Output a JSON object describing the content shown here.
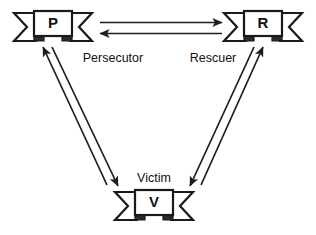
{
  "diagram": {
    "background_color": "#ffffff",
    "line_color": "#1d1d1d",
    "text_color": "#111111",
    "nodes": [
      {
        "id": "persecutor",
        "letter": "P",
        "label": "Persecutor",
        "shape": "ribbon-banner",
        "position": "top-left"
      },
      {
        "id": "rescuer",
        "letter": "R",
        "label": "Rescuer",
        "shape": "ribbon-banner",
        "position": "top-right"
      },
      {
        "id": "victim",
        "letter": "V",
        "label": "Victim",
        "shape": "ribbon-banner",
        "position": "bottom-center"
      }
    ],
    "edges": [
      {
        "id": "persecutor-to-rescuer",
        "from": "persecutor",
        "to": "rescuer",
        "direction": "right",
        "style": "single-arrow"
      },
      {
        "id": "rescuer-to-persecutor",
        "from": "rescuer",
        "to": "persecutor",
        "direction": "left",
        "style": "single-arrow"
      },
      {
        "id": "victim-to-persecutor",
        "from": "victim",
        "to": "persecutor",
        "direction": "up-left",
        "style": "single-arrow"
      },
      {
        "id": "persecutor-to-victim",
        "from": "persecutor",
        "to": "victim",
        "direction": "down-right",
        "style": "single-arrow"
      },
      {
        "id": "victim-to-rescuer",
        "from": "victim",
        "to": "rescuer",
        "direction": "up-right",
        "style": "single-arrow"
      },
      {
        "id": "rescuer-to-victim",
        "from": "rescuer",
        "to": "victim",
        "direction": "down-left",
        "style": "single-arrow"
      }
    ]
  }
}
